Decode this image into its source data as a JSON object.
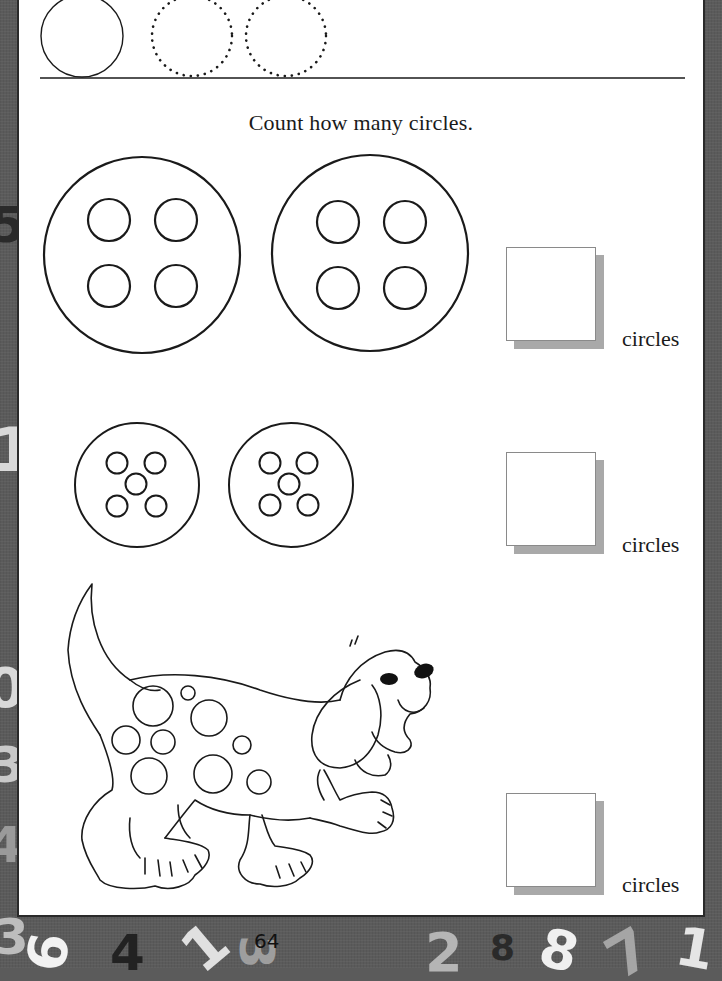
{
  "worksheet": {
    "instruction": "Count how many circles.",
    "tracing_row": {
      "solid_circles": 1,
      "dotted_circles": 2
    },
    "exercises": [
      {
        "id": "large-buttons",
        "groups": 2,
        "circles_per_group": 4,
        "answer_value": "",
        "answer_label": "circles"
      },
      {
        "id": "small-buttons",
        "groups": 2,
        "circles_per_group": 5,
        "answer_value": "",
        "answer_label": "circles"
      },
      {
        "id": "spotted-dog",
        "spots": 10,
        "answer_value": "",
        "answer_label": "circles"
      }
    ],
    "page_number": "64"
  },
  "frame": {
    "background_color": "#5b5b5b",
    "numerals": [
      {
        "text": "5",
        "color": "#2a2a2a"
      },
      {
        "text": "1",
        "color": "#d9d9d9"
      },
      {
        "text": "0",
        "color": "#d9d9d9"
      },
      {
        "text": "3",
        "color": "#c9c9c9"
      },
      {
        "text": "4",
        "color": "#9a9a9a"
      },
      {
        "text": "3",
        "color": "#bdbdbd"
      },
      {
        "text": "6",
        "color": "#f2f2f2"
      },
      {
        "text": "4",
        "color": "#222222"
      },
      {
        "text": "1",
        "color": "#e0e0e0"
      },
      {
        "text": "3",
        "color": "#9e9e9e"
      },
      {
        "text": "2",
        "color": "#b5b5b5"
      },
      {
        "text": "8",
        "color": "#2a2a2a"
      },
      {
        "text": "8",
        "color": "#f0f0f0"
      },
      {
        "text": "7",
        "color": "#a5a5a5"
      },
      {
        "text": "1",
        "color": "#e5e5e5"
      }
    ]
  }
}
